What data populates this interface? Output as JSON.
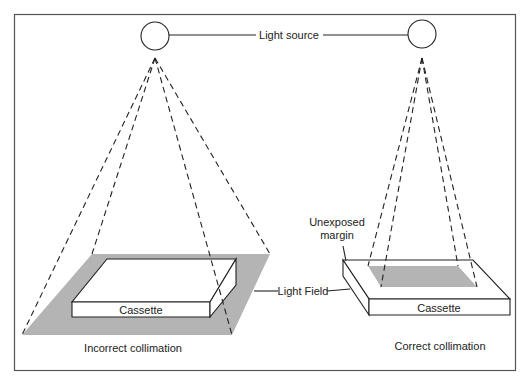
{
  "diagram": {
    "colors": {
      "frame": "#555555",
      "line": "#222222",
      "light_field": "#b4b4b4",
      "background": "#ffffff"
    },
    "labels": {
      "light_source": "Light source",
      "light_field": "Light Field",
      "unexposed_margin_line1": "Unexposed",
      "unexposed_margin_line2": "margin",
      "cassette_left": "Cassette",
      "cassette_right": "Cassette",
      "caption_left": "Incorrect collimation",
      "caption_right": "Correct collimation"
    },
    "panels": [
      {
        "id": "incorrect",
        "caption": "Incorrect collimation",
        "light_field_larger_than_cassette": true
      },
      {
        "id": "correct",
        "caption": "Correct collimation",
        "light_field_larger_than_cassette": false
      }
    ]
  }
}
